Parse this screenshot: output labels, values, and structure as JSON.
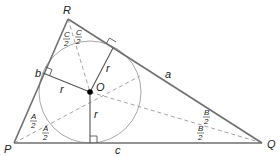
{
  "diagram": {
    "vertices": {
      "P": {
        "label": "P",
        "x": 14,
        "y": 143
      },
      "Q": {
        "label": "Q",
        "x": 262,
        "y": 143
      },
      "R": {
        "label": "R",
        "x": 68,
        "y": 19
      }
    },
    "center": {
      "label": "O",
      "x": 90,
      "y": 92
    },
    "radius": 51,
    "sides": {
      "a": {
        "label": "a",
        "between": "R-Q"
      },
      "b": {
        "label": "b",
        "between": "P-R"
      },
      "c": {
        "label": "c",
        "between": "P-Q"
      }
    },
    "radius_label": "r",
    "half_angles": {
      "A": {
        "num": "A",
        "den": "2",
        "vertex": "P"
      },
      "B": {
        "num": "B",
        "den": "2",
        "vertex": "Q"
      },
      "C": {
        "num": "C",
        "den": "2",
        "vertex": "R"
      }
    },
    "colors": {
      "sides": "#6f6f6f",
      "bisectors": "#9a9a9a",
      "circle": "#a8a8a8",
      "center_dot": "#000000"
    }
  }
}
